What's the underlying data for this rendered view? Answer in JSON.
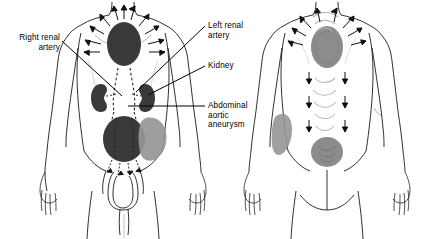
{
  "figure": {
    "views": [
      {
        "name": "anterior-view",
        "label": "Anterior (front) view of male torso"
      },
      {
        "name": "posterior-view",
        "label": "Posterior (back) view of male torso"
      }
    ]
  },
  "labels": [
    {
      "id": "right-renal-artery",
      "text": "Right renal\nartery",
      "align": "right",
      "x": 2,
      "y": 33
    },
    {
      "id": "left-renal-artery",
      "text": "Left renal\nartery",
      "align": "left",
      "x": 208,
      "y": 21
    },
    {
      "id": "kidney",
      "text": "Kidney",
      "align": "left",
      "x": 208,
      "y": 61
    },
    {
      "id": "abdominal-aortic-aneurysm",
      "text": "Abdominal\naortic\naneurysm",
      "align": "left",
      "x": 208,
      "y": 101
    }
  ],
  "colors": {
    "outline": "#1a1a1a",
    "dark_lesion": "#3a3a3a",
    "mid_gray": "#8c8c8c",
    "light_gray": "#9a9a9a",
    "pale_gray": "#b8b8b8",
    "background": "#ffffff",
    "leader_line": "#000000"
  },
  "anterior_regions": [
    {
      "id": "chest-epigastric-pain",
      "shade": "dark",
      "note": "Dark oval over sternum/epigastrium with radiating arrows"
    },
    {
      "id": "right-kidney",
      "shade": "dark",
      "note": "Bean-shaped right kidney"
    },
    {
      "id": "left-kidney",
      "shade": "dark",
      "note": "Bean-shaped left kidney"
    },
    {
      "id": "aorta-dashed-outline",
      "shade": "none",
      "note": "Dashed outline of abdominal aorta and iliac branches"
    },
    {
      "id": "aneurysm-mass",
      "shade": "dark",
      "note": "Large dark aneurysm sac below renal arteries"
    },
    {
      "id": "left-flank-referred-pain",
      "shade": "mid",
      "note": "Gray referred-pain blob on patient's left flank"
    }
  ],
  "posterior_regions": [
    {
      "id": "upper-back-pain",
      "shade": "mid",
      "note": "Gray oval over upper thoracic spine with radiating arrows"
    },
    {
      "id": "lumbar-arcs",
      "shade": "pale",
      "note": "Curved arcs with vertical arrows down the lumbar spine"
    },
    {
      "id": "sacral-pain",
      "shade": "mid",
      "note": "Gray circle over sacrum"
    },
    {
      "id": "left-flank-referred-pain-back",
      "shade": "mid",
      "note": "Gray blob on left flank, posterior"
    }
  ]
}
